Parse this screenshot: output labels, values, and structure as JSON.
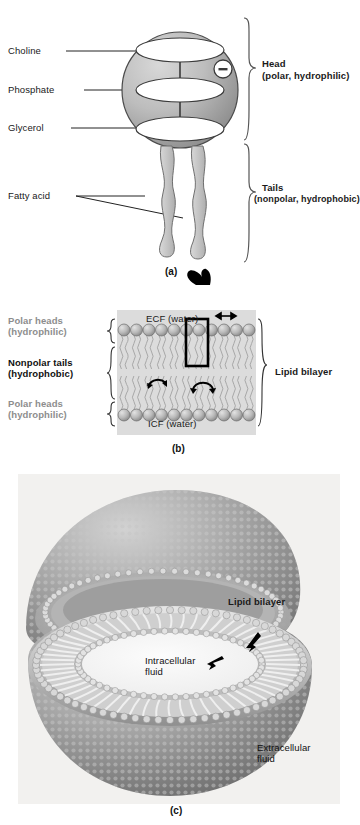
{
  "figure": {
    "panels": [
      {
        "id": "a",
        "caption": "(a)"
      },
      {
        "id": "b",
        "caption": "(b)"
      },
      {
        "id": "c",
        "caption": "(c)"
      }
    ]
  },
  "panel_a": {
    "caption": "(a)",
    "left_labels": [
      {
        "name": "choline",
        "text": "Choline"
      },
      {
        "name": "phosphate",
        "text": "Phosphate"
      },
      {
        "name": "glycerol",
        "text": "Glycerol"
      },
      {
        "name": "fatty-acid",
        "text": "Fatty acid"
      }
    ],
    "right_labels": [
      {
        "name": "head",
        "line1": "Head",
        "line2": "(polar, hydrophilic)"
      },
      {
        "name": "tails",
        "line1": "Tails",
        "line2": "(nonpolar, hydrophobic)"
      }
    ],
    "charge_symbol": "–",
    "colors": {
      "head_fill_light": "#c9c9c9",
      "head_fill_dark": "#8e8e8e",
      "tail_fill": "#c4c4c4",
      "outline": "#333333"
    }
  },
  "panel_b": {
    "caption": "(b)",
    "left_labels": [
      {
        "name": "polar-heads-top",
        "line1": "Polar heads",
        "line2": "(hydrophilic)",
        "style": "gray"
      },
      {
        "name": "nonpolar-tails",
        "line1": "Nonpolar tails",
        "line2": "(hydrophobic)",
        "style": "dark"
      },
      {
        "name": "polar-heads-bottom",
        "line1": "Polar heads",
        "line2": "(hydrophilic)",
        "style": "gray"
      }
    ],
    "fluid_labels": {
      "outside": "ECF (water)",
      "inside": "ICF (water)"
    },
    "right_label": "Lipid bilayer",
    "lipid_count_per_row": 11,
    "highlight_index": 7,
    "motion_arrows": [
      "lateral-shift",
      "flexion",
      "rotation"
    ],
    "colors": {
      "fluid_bg": "#dcdcdc",
      "head_fill": "#b6b6b6",
      "tail_stroke": "#a8a8a8",
      "highlight_box": "#000000"
    }
  },
  "panel_c": {
    "caption": "(c)",
    "labels": [
      {
        "name": "lipid-bilayer",
        "text": "Lipid bilayer",
        "style": "bold"
      },
      {
        "name": "intracellular-fluid",
        "line1": "Intracellular",
        "line2": "fluid",
        "style": "regular"
      },
      {
        "name": "extracellular-fluid",
        "line1": "Extracellular",
        "line2": "fluid",
        "style": "regular"
      }
    ],
    "colors": {
      "photo_bg": "#f2f2f0",
      "membrane_mid": "#9a9a9a",
      "membrane_dark": "#6f6f6f",
      "membrane_light": "#d6d6d6"
    }
  }
}
